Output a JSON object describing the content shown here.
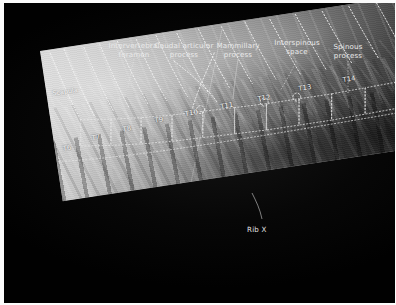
{
  "figure": {
    "kind": "annotated-radiograph",
    "background_color": "#050505",
    "border_color": "#fbfbfb",
    "annotation_color": "#f2f2f2"
  },
  "callouts": [
    {
      "id": "intervertebral-foramen",
      "label": "Intervertebral\nforamen"
    },
    {
      "id": "caudal-articular-process",
      "label": "Caudal articular\nprocess"
    },
    {
      "id": "mammillary-process",
      "label": "Mammillary\nprocess"
    },
    {
      "id": "interspinous-space",
      "label": "Interspinous\nspace"
    },
    {
      "id": "spinous-process",
      "label": "Spinous\nprocess"
    }
  ],
  "film_labels": [
    {
      "id": "scapula",
      "label": "Scapula"
    }
  ],
  "bottom_labels": [
    {
      "id": "rib-x",
      "label": "Rib X"
    }
  ],
  "vertebrae": [
    {
      "id": "t6",
      "label": "T6"
    },
    {
      "id": "t7",
      "label": "T7"
    },
    {
      "id": "t8",
      "label": "T8"
    },
    {
      "id": "t9",
      "label": "T9"
    },
    {
      "id": "t10",
      "label": "T10"
    },
    {
      "id": "t11",
      "label": "T11"
    },
    {
      "id": "t12",
      "label": "T12"
    },
    {
      "id": "t13",
      "label": "T13"
    },
    {
      "id": "t14",
      "label": "T14"
    }
  ]
}
